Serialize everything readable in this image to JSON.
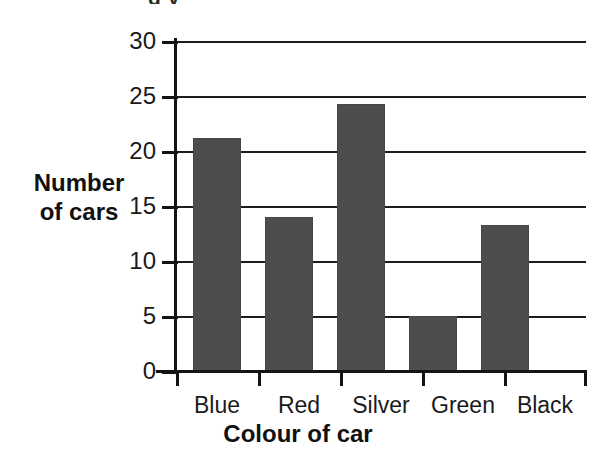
{
  "figure": {
    "title_remnant": "g y",
    "background_color": "#ffffff",
    "ink_color": "#1a1a1a"
  },
  "chart_data": {
    "type": "bar",
    "title": "",
    "categories": [
      "Blue",
      "Red",
      "Silver",
      "Green",
      "Black"
    ],
    "values": [
      21.2,
      14.0,
      24.3,
      5.0,
      13.3
    ],
    "xlabel": "Colour of car",
    "ylabel": "Number of cars",
    "ylabel_lines": [
      "Number",
      "of cars"
    ],
    "ylim": [
      0,
      30
    ],
    "ytick_values": [
      0,
      5,
      10,
      15,
      20,
      25,
      30
    ],
    "ytick_labels": [
      "0",
      "5",
      "10",
      "15",
      "20",
      "25",
      "30"
    ],
    "grid": true,
    "grid_axis": "y",
    "legend": false,
    "bar_color": "#4d4d4d",
    "bar_edge_color": "#474747"
  }
}
